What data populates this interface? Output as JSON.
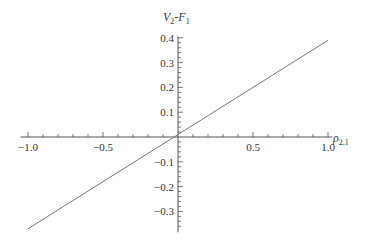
{
  "chart_data": {
    "type": "line",
    "title": "",
    "xlabel": "ρ_{2,1}",
    "ylabel": "V_2-F_1",
    "xlim": [
      -1.0,
      1.0
    ],
    "ylim": [
      -0.37,
      0.4
    ],
    "x_ticks": [
      "-1.0",
      "-0.5",
      "0.5",
      "1.0"
    ],
    "y_ticks": [
      "0.4",
      "0.3",
      "0.2",
      "0.1",
      "-0.1",
      "-0.2",
      "-0.3"
    ],
    "grid": false,
    "legend": null,
    "series": [
      {
        "name": "V2-F1",
        "x": [
          -1.0,
          0.0,
          1.0
        ],
        "y": [
          -0.37,
          0.01,
          0.39
        ]
      }
    ]
  },
  "labels": {
    "x_axis_main": "ρ",
    "x_axis_sub": "2,1",
    "y_axis_V": "V",
    "y_axis_V_sub": "2",
    "y_axis_dash": "-F",
    "y_axis_F_sub": "1"
  }
}
